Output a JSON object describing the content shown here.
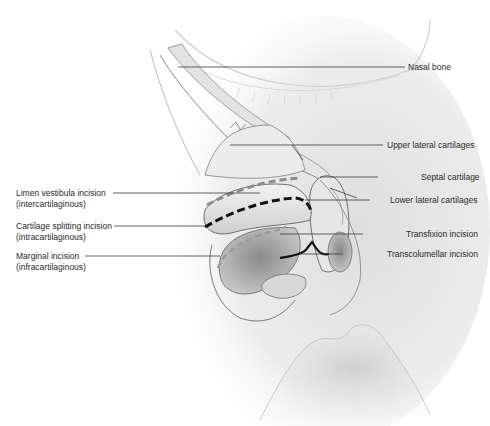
{
  "figure": {
    "colors": {
      "skin_shade": "#d9d9d9",
      "outline": "#6e6e6e",
      "leader_line": "#3a3a3a",
      "incision_dark": "#111111",
      "incision_gray": "#9a9a9a",
      "text": "#2a2a2a",
      "background": "#ffffff"
    }
  },
  "labels_left": [
    {
      "title": "Limen vestibula incision",
      "subtitle": "(intercartilaginous)"
    },
    {
      "title": "Cartilage splitting incision",
      "subtitle": "(intracartilaginous)"
    },
    {
      "title": "Marginal incision",
      "subtitle": "(infracartilaginous)"
    }
  ],
  "labels_right": [
    {
      "title": "Nasal bone"
    },
    {
      "title": "Upper lateral cartilages"
    },
    {
      "title": "Septal cartilage"
    },
    {
      "title": "Lower lateral cartilages"
    },
    {
      "title": "Transfixion incision"
    },
    {
      "title": "Transcolumellar incision"
    }
  ]
}
